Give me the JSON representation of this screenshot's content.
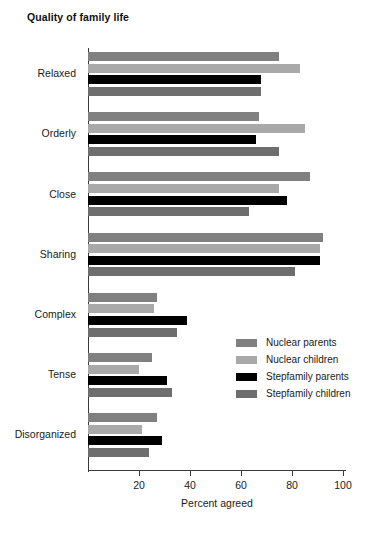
{
  "chart_title": "Quality of family life",
  "axis": {
    "x_title": "Percent agreed",
    "x_ticks": [
      "20",
      "40",
      "60",
      "80",
      "100"
    ],
    "x_tick_values": [
      20,
      40,
      60,
      80,
      100
    ]
  },
  "legend": {
    "items": [
      {
        "label": "Nuclear parents",
        "color": "#808080"
      },
      {
        "label": "Nuclear children",
        "color": "#a9a9a9"
      },
      {
        "label": "Stepfamily parents",
        "color": "#000000"
      },
      {
        "label": "Stepfamily children",
        "color": "#6e6e6e"
      }
    ]
  },
  "chart_data": {
    "type": "bar",
    "orientation": "horizontal",
    "title": "Quality of family life",
    "xlabel": "Percent agreed",
    "ylabel": "",
    "xlim": [
      0,
      105
    ],
    "grid": false,
    "legend_position": "inside-right",
    "categories": [
      "Relaxed",
      "Orderly",
      "Close",
      "Sharing",
      "Complex",
      "Tense",
      "Disorganized"
    ],
    "series": [
      {
        "name": "Nuclear parents",
        "color": "#808080",
        "values": [
          75,
          67,
          87,
          92,
          27,
          25,
          27
        ]
      },
      {
        "name": "Nuclear children",
        "color": "#a9a9a9",
        "values": [
          83,
          85,
          75,
          91,
          26,
          20,
          21
        ]
      },
      {
        "name": "Stepfamily parents",
        "color": "#000000",
        "values": [
          68,
          66,
          78,
          91,
          39,
          31,
          29
        ]
      },
      {
        "name": "Stepfamily children",
        "color": "#6e6e6e",
        "values": [
          68,
          75,
          63,
          81,
          35,
          33,
          24
        ]
      }
    ]
  }
}
